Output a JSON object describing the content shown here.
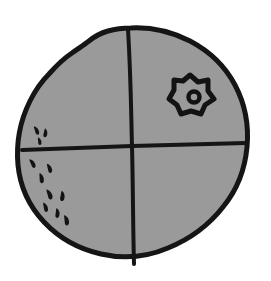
{
  "figure": {
    "title": "Quadrant diagram of a shaded circular region",
    "colors": {
      "background": "#ffffff",
      "fill": "#9a9a9a",
      "outline": "#151515",
      "divider": "#151515",
      "marker": "#131313"
    },
    "canvas": {
      "width": 271,
      "height": 281
    },
    "circle": {
      "label": "circular-outline",
      "center_x": 135,
      "center_y": 146,
      "radius_x": 113,
      "radius_y": 119,
      "stroke_width": 5,
      "style": "hand-drawn-irregular"
    },
    "dividers": [
      {
        "label": "vertical-divider",
        "x1": 128,
        "y1": 28,
        "x2": 134,
        "y2": 265,
        "stroke_width": 4
      },
      {
        "label": "horizontal-divider",
        "x1": 22,
        "y1": 150,
        "x2": 246,
        "y2": 144,
        "stroke_width": 4
      }
    ],
    "quadrants": [
      {
        "name": "upper-left",
        "marks": 3,
        "mark_type": "comma-stipple"
      },
      {
        "name": "upper-right",
        "marks": 1,
        "mark_type": "star-lesion"
      },
      {
        "name": "lower-left",
        "marks": 11,
        "mark_type": "comma-stipple"
      },
      {
        "name": "lower-right",
        "marks": 0,
        "mark_type": "none"
      }
    ],
    "star_marker": {
      "label": "star-lesion-marker",
      "center_x": 190,
      "center_y": 94,
      "outer_radius": 19,
      "inner_radius": 11,
      "points": 6,
      "stroke_width": 5,
      "inner_dot_x": 194,
      "inner_dot_y": 97,
      "inner_dot_radius": 5
    },
    "stipple_marks": [
      {
        "x": 37,
        "y": 130,
        "rot": -18,
        "w": 4.0,
        "h": 9.5
      },
      {
        "x": 45,
        "y": 133,
        "rot": 10,
        "w": 4.0,
        "h": 9.0
      },
      {
        "x": 40,
        "y": 141,
        "rot": -8,
        "w": 3.6,
        "h": 8.0
      },
      {
        "x": 33,
        "y": 163,
        "rot": -22,
        "w": 4.2,
        "h": 10.0
      },
      {
        "x": 50,
        "y": 168,
        "rot": -12,
        "w": 4.2,
        "h": 10.0
      },
      {
        "x": 42,
        "y": 178,
        "rot": -5,
        "w": 4.4,
        "h": 10.5
      },
      {
        "x": 50,
        "y": 194,
        "rot": -15,
        "w": 4.4,
        "h": 11.0
      },
      {
        "x": 62,
        "y": 196,
        "rot": 8,
        "w": 4.4,
        "h": 10.5
      },
      {
        "x": 46,
        "y": 207,
        "rot": -10,
        "w": 4.2,
        "h": 10.0
      },
      {
        "x": 57,
        "y": 213,
        "rot": 5,
        "w": 4.2,
        "h": 10.0
      },
      {
        "x": 66,
        "y": 219,
        "rot": -8,
        "w": 4.4,
        "h": 11.0
      }
    ]
  }
}
